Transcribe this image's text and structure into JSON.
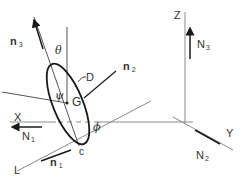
{
  "diagram": {
    "title": "",
    "labels": {
      "Z": "Z",
      "X": "X",
      "Y": "Y",
      "L": "L",
      "G": "G",
      "C": "c",
      "D": "D",
      "theta": "θ",
      "psi": "ψ",
      "phi": "ϕ",
      "n1": "n",
      "n1_sub": "1",
      "n2": "n",
      "n2_sub": "2",
      "n3": "n",
      "n3_sub": "3",
      "N1": "N",
      "N1_sub": "1",
      "N2": "N",
      "N2_sub": "2",
      "N3": "N",
      "N3_sub": "3"
    },
    "colors": {
      "line": "#7a7a7a",
      "ink": "#1a1a1a",
      "text": "#333333"
    }
  }
}
